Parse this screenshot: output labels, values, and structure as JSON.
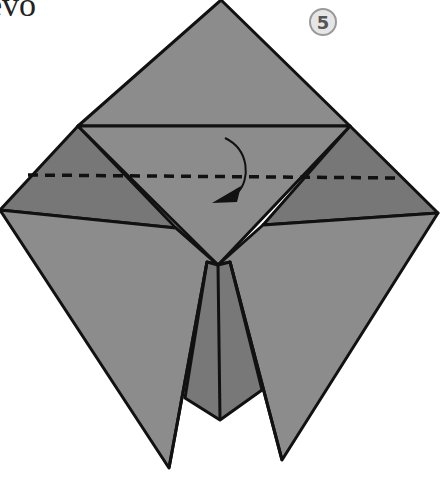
{
  "title": "uevo",
  "step": {
    "number": "5"
  },
  "diagram": {
    "colors": {
      "paper_main": "#8c8c8c",
      "paper_dark": "#777777",
      "paper_darker": "#6e6e6e",
      "line": "#111111",
      "background": "#ffffff",
      "badge_fill": "#e6e6e6",
      "badge_stroke": "#9a9a9a"
    },
    "annotations": {
      "fold_line": "dashed valley fold",
      "arrow": "fold down"
    }
  }
}
